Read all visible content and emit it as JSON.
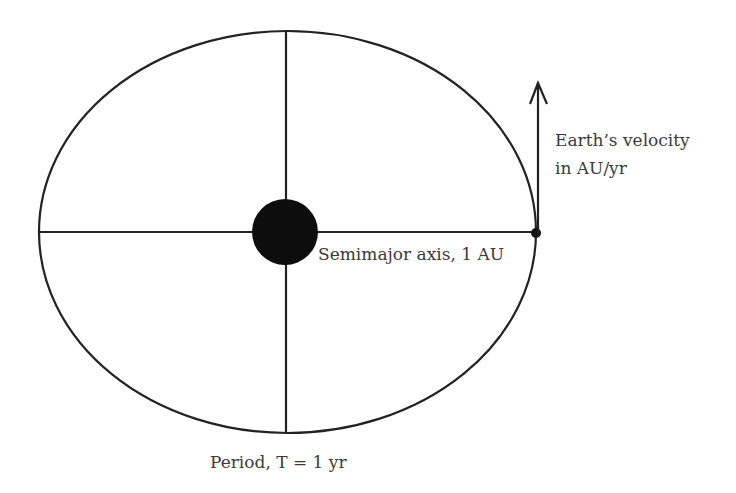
{
  "diagram": {
    "labels": {
      "velocity_line1": "Earth’s velocity",
      "velocity_line2": "in AU/yr",
      "semimajor": "Semimajor axis, 1 AU",
      "period": "Period, T = 1 yr"
    },
    "colors": {
      "stroke": "#222222",
      "sun": "#0d0d0d",
      "text": "#3a3a3a"
    }
  }
}
